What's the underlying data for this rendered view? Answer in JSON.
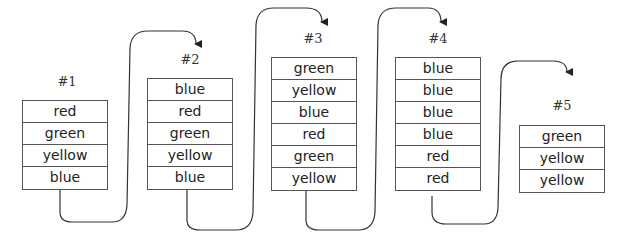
{
  "stacks": [
    {
      "label": "#1",
      "x": 22,
      "y": 100,
      "labelX": 47,
      "labelY": 74,
      "items": [
        "red",
        "green",
        "yellow",
        "blue"
      ]
    },
    {
      "label": "#2",
      "x": 147,
      "y": 78,
      "labelX": 170,
      "labelY": 52,
      "items": [
        "blue",
        "red",
        "green",
        "yellow",
        "blue"
      ]
    },
    {
      "label": "#3",
      "x": 271,
      "y": 57,
      "labelX": 293,
      "labelY": 31,
      "items": [
        "green",
        "yellow",
        "blue",
        "red",
        "green",
        "yellow"
      ]
    },
    {
      "label": "#4",
      "x": 395,
      "y": 57,
      "labelX": 418,
      "labelY": 31,
      "items": [
        "blue",
        "blue",
        "blue",
        "blue",
        "red",
        "red"
      ]
    },
    {
      "label": "#5",
      "x": 519,
      "y": 125,
      "labelX": 542,
      "labelY": 98,
      "items": [
        "green",
        "yellow",
        "yellow"
      ]
    }
  ],
  "stroke_color": "#333333"
}
